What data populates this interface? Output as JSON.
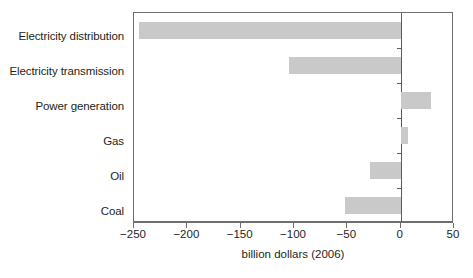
{
  "chart_data": {
    "type": "bar",
    "orientation": "horizontal",
    "title": "",
    "subtitle": "",
    "xlabel": "billion dollars (2006)",
    "ylabel": "",
    "categories": [
      "Electricity distribution",
      "Electricity transmission",
      "Power generation",
      "Gas",
      "Oil",
      "Coal"
    ],
    "values": [
      -245,
      -105,
      28,
      7,
      -29,
      -52
    ],
    "series": [
      {
        "name": "Investment change",
        "values": [
          -245,
          -105,
          28,
          7,
          -29,
          -52
        ]
      }
    ],
    "xlim": [
      -250,
      50
    ],
    "xticks": [
      -250,
      -200,
      -150,
      -100,
      -50,
      0,
      50
    ],
    "xticklabels": [
      "−250",
      "−200",
      "−150",
      "−100",
      "−50",
      "0",
      "50"
    ],
    "grid": false,
    "legend": false,
    "legend_position": "none",
    "bar_color": "#c9c9c9",
    "axis_color": "#6e6e6e",
    "zero_line": 0,
    "annotations": []
  }
}
